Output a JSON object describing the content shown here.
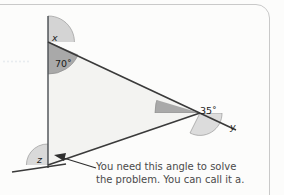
{
  "figure": {
    "type": "geometry-diagram",
    "angles": [
      {
        "id": "x",
        "label": "x",
        "kind": "variable",
        "position": "upper-left-exterior",
        "shade": "light"
      },
      {
        "id": "a70",
        "label": "70˚",
        "kind": "measure",
        "value": 70,
        "unit": "degrees",
        "position": "upper-left-interior",
        "shade": "dark"
      },
      {
        "id": "a35",
        "label": "35˚",
        "kind": "measure",
        "value": 35,
        "unit": "degrees",
        "position": "right-interior",
        "shade": "dark"
      },
      {
        "id": "y",
        "label": "y",
        "kind": "variable",
        "position": "right-exterior",
        "shade": "light"
      },
      {
        "id": "z",
        "label": "z",
        "kind": "variable",
        "position": "lower-left-exterior",
        "shade": "light"
      }
    ],
    "unknown_angle_name": "a",
    "colors": {
      "line": "#3a3a3a",
      "triangle_fill": "#f3f3f1",
      "arc_dark": "#a9a9a9",
      "arc_light": "#d4d4d4",
      "border": "#c9c9c9",
      "caption_text": "#4a4a4a"
    }
  },
  "callout": {
    "line1": "You need this angle to solve",
    "line2": "the problem. You can call it a.",
    "arrow": "arrow-pointing-left"
  }
}
